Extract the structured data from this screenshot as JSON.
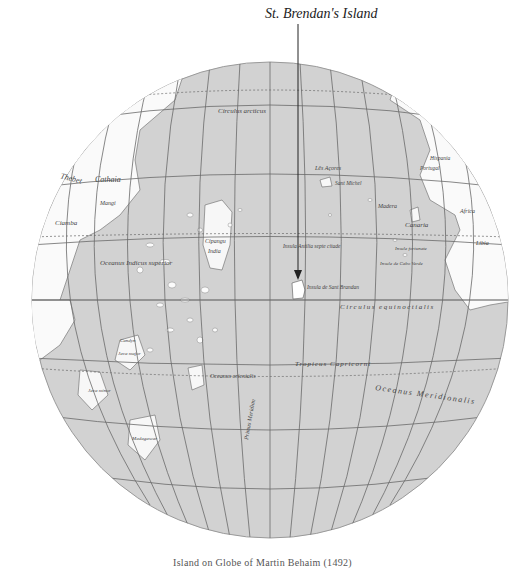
{
  "title": "St. Brendan's Island",
  "caption": "Island on Globe of Martin Behaim (1492)",
  "colors": {
    "sea": "#d2d2d2",
    "land": "#fafafa",
    "grid": "#6a6a6a",
    "text": "#444444",
    "pointer": "#222222"
  },
  "labels": {
    "circulus_arcticus": "Circulus arcticus",
    "circulus_equinoctialis": "Circulus equinoctialis",
    "tropicus_cancri": "Tropicus Cancri",
    "tropicus_capricorni": "Tropicus Capricorni",
    "oceanus_meridionalis": "Oceanus Meridionalis",
    "oceanus_indicus_superior": "Oceanus Indicus superior",
    "oceanus_orientalis": "Oceanus orientalis",
    "primus_meridian": "Primus Meridian",
    "insula_de_sant_brandan": "Insula de Sant Brandan",
    "insula_antilia": "Insula Antilia septe citade",
    "cipangu": "Cipangu",
    "india": "India",
    "cathaia": "Cathaia",
    "thebet": "Thebet",
    "mangi": "Mangi",
    "ciamba": "Ciamba",
    "candyn": "Candyn",
    "java_major": "Java major",
    "java_minor": "Java minor",
    "seilan": "Seilan",
    "madagascar": "Madagascar",
    "zanzibar": "Zanzibar",
    "les_acores": "Lês Açores",
    "cabo_verde": "Insule de Cabo Verde",
    "canaria": "Canaria",
    "madera": "Madera",
    "hispania": "Hispania",
    "portugal": "Portugal",
    "africa": "Africa",
    "libia": "Libia",
    "ethiopia": "Ethiopia",
    "gronland": "Gronland",
    "ylant": "Ylant",
    "sant_michel": "Sant Michel",
    "insule_fortunate": "Insule fortunate"
  }
}
